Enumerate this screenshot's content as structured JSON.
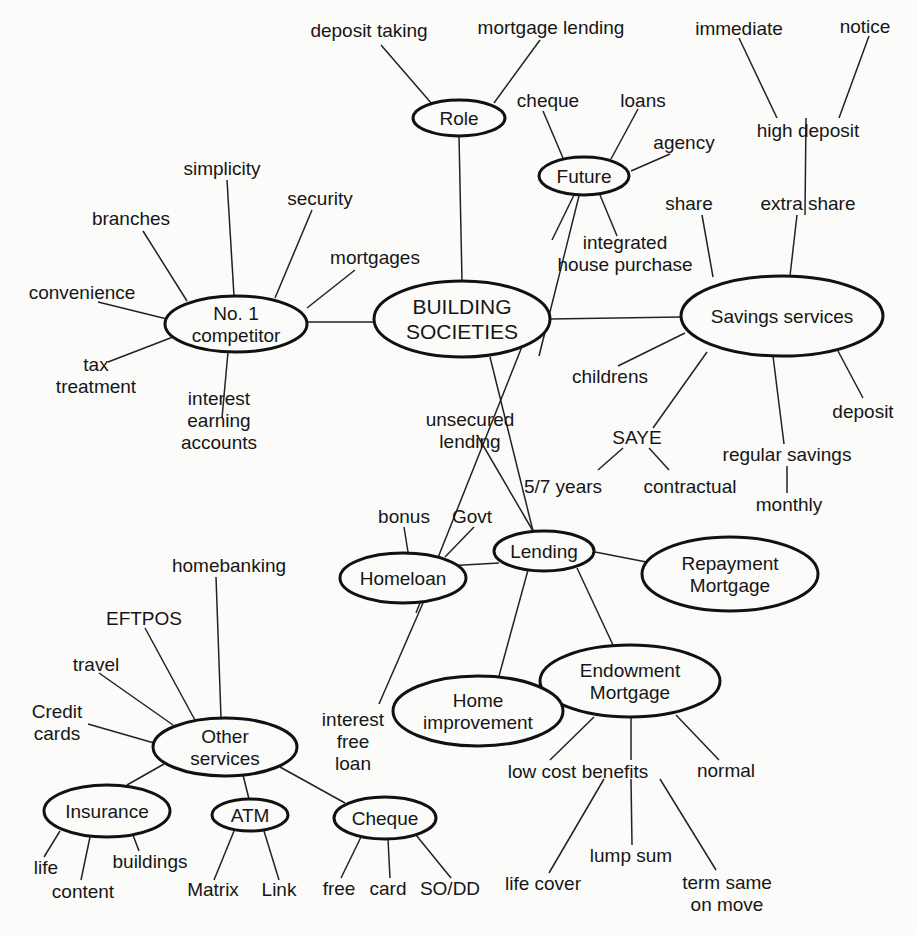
{
  "colors": {
    "ink": "#161616",
    "background": "#fbfbf9"
  },
  "nodes": [
    {
      "id": "building_societies",
      "lines": [
        "BUILDING",
        "SOCIETIES"
      ],
      "type": "ellipse",
      "cx": 462,
      "cy": 319,
      "rx": 88,
      "ry": 38,
      "hub": true
    },
    {
      "id": "role",
      "lines": [
        "Role"
      ],
      "type": "ellipse",
      "cx": 459,
      "cy": 118,
      "rx": 46,
      "ry": 18
    },
    {
      "id": "future",
      "lines": [
        "Future"
      ],
      "type": "ellipse",
      "cx": 584,
      "cy": 176,
      "rx": 45,
      "ry": 19
    },
    {
      "id": "no1_competitor",
      "lines": [
        "No. 1",
        "competitor"
      ],
      "type": "ellipse",
      "cx": 236,
      "cy": 324,
      "rx": 71,
      "ry": 28
    },
    {
      "id": "savings_services",
      "lines": [
        "Savings services"
      ],
      "type": "ellipse",
      "cx": 782,
      "cy": 316,
      "rx": 101,
      "ry": 40
    },
    {
      "id": "lending",
      "lines": [
        "Lending"
      ],
      "type": "ellipse",
      "cx": 544,
      "cy": 551,
      "rx": 50,
      "ry": 20
    },
    {
      "id": "homeloan",
      "lines": [
        "Homeloan"
      ],
      "type": "ellipse",
      "cx": 403,
      "cy": 578,
      "rx": 63,
      "ry": 25
    },
    {
      "id": "repayment_mortgage",
      "lines": [
        "Repayment",
        "Mortgage"
      ],
      "type": "ellipse",
      "cx": 730,
      "cy": 574,
      "rx": 88,
      "ry": 37
    },
    {
      "id": "endowment_mortgage",
      "lines": [
        "Endowment",
        "Mortgage"
      ],
      "type": "ellipse",
      "cx": 630,
      "cy": 681,
      "rx": 90,
      "ry": 36
    },
    {
      "id": "home_improvement",
      "lines": [
        "Home",
        "improvement"
      ],
      "type": "ellipse",
      "cx": 478,
      "cy": 711,
      "rx": 85,
      "ry": 35
    },
    {
      "id": "other_services",
      "lines": [
        "Other",
        "services"
      ],
      "type": "ellipse",
      "cx": 225,
      "cy": 747,
      "rx": 72,
      "ry": 29
    },
    {
      "id": "insurance",
      "lines": [
        "Insurance"
      ],
      "type": "ellipse",
      "cx": 107,
      "cy": 811,
      "rx": 63,
      "ry": 26
    },
    {
      "id": "atm",
      "lines": [
        "ATM"
      ],
      "type": "ellipse",
      "cx": 250,
      "cy": 815,
      "rx": 38,
      "ry": 16
    },
    {
      "id": "cheque_node",
      "lines": [
        "Cheque"
      ],
      "type": "ellipse",
      "cx": 385,
      "cy": 818,
      "rx": 51,
      "ry": 21
    },
    {
      "id": "deposit_taking",
      "lines": [
        "deposit taking"
      ],
      "type": "text",
      "cx": 369,
      "cy": 30
    },
    {
      "id": "mortgage_lending",
      "lines": [
        "mortgage lending"
      ],
      "type": "text",
      "cx": 551,
      "cy": 27
    },
    {
      "id": "cheque",
      "lines": [
        "cheque"
      ],
      "type": "text",
      "cx": 548,
      "cy": 100
    },
    {
      "id": "loans",
      "lines": [
        "loans"
      ],
      "type": "text",
      "cx": 643,
      "cy": 100
    },
    {
      "id": "agency",
      "lines": [
        "agency"
      ],
      "type": "text",
      "cx": 684,
      "cy": 142
    },
    {
      "id": "integrated_house_purchase",
      "lines": [
        "integrated",
        "house purchase"
      ],
      "type": "text",
      "cx": 625,
      "cy": 253
    },
    {
      "id": "immediate",
      "lines": [
        "immediate"
      ],
      "type": "text",
      "cx": 739,
      "cy": 28
    },
    {
      "id": "notice",
      "lines": [
        "notice"
      ],
      "type": "text",
      "cx": 865,
      "cy": 26
    },
    {
      "id": "high_deposit",
      "lines": [
        "high deposit"
      ],
      "type": "text",
      "cx": 808,
      "cy": 130
    },
    {
      "id": "share",
      "lines": [
        "share"
      ],
      "type": "text",
      "cx": 689,
      "cy": 203
    },
    {
      "id": "extra_share",
      "lines": [
        "extra share"
      ],
      "type": "text",
      "cx": 808,
      "cy": 203
    },
    {
      "id": "childrens",
      "lines": [
        "childrens"
      ],
      "type": "text",
      "cx": 610,
      "cy": 376
    },
    {
      "id": "deposit",
      "lines": [
        "deposit"
      ],
      "type": "text",
      "cx": 863,
      "cy": 411
    },
    {
      "id": "saye",
      "lines": [
        "SAYE"
      ],
      "type": "text",
      "cx": 637,
      "cy": 437
    },
    {
      "id": "regular_savings",
      "lines": [
        "regular savings"
      ],
      "type": "text",
      "cx": 787,
      "cy": 454
    },
    {
      "id": "five_seven_years",
      "lines": [
        "5/7 years"
      ],
      "type": "text",
      "cx": 563,
      "cy": 486
    },
    {
      "id": "contractual",
      "lines": [
        "contractual"
      ],
      "type": "text",
      "cx": 690,
      "cy": 486
    },
    {
      "id": "monthly",
      "lines": [
        "monthly"
      ],
      "type": "text",
      "cx": 789,
      "cy": 504
    },
    {
      "id": "simplicity",
      "lines": [
        "simplicity"
      ],
      "type": "text",
      "cx": 222,
      "cy": 168
    },
    {
      "id": "security",
      "lines": [
        "security"
      ],
      "type": "text",
      "cx": 320,
      "cy": 198
    },
    {
      "id": "branches",
      "lines": [
        "branches"
      ],
      "type": "text",
      "cx": 131,
      "cy": 218
    },
    {
      "id": "mortgages",
      "lines": [
        "mortgages"
      ],
      "type": "text",
      "cx": 375,
      "cy": 257
    },
    {
      "id": "convenience",
      "lines": [
        "convenience"
      ],
      "type": "text",
      "cx": 82,
      "cy": 292
    },
    {
      "id": "tax_treatment",
      "lines": [
        "tax",
        "treatment"
      ],
      "type": "text",
      "cx": 96,
      "cy": 375
    },
    {
      "id": "interest_earning_accounts",
      "lines": [
        "interest",
        "earning",
        "accounts"
      ],
      "type": "text",
      "cx": 219,
      "cy": 420
    },
    {
      "id": "unsecured_lending",
      "lines": [
        "unsecured",
        "lending"
      ],
      "type": "text",
      "cx": 470,
      "cy": 430
    },
    {
      "id": "bonus",
      "lines": [
        "bonus"
      ],
      "type": "text",
      "cx": 404,
      "cy": 516
    },
    {
      "id": "govt",
      "lines": [
        "Govt"
      ],
      "type": "text",
      "cx": 472,
      "cy": 516
    },
    {
      "id": "homebanking",
      "lines": [
        "homebanking"
      ],
      "type": "text",
      "cx": 229,
      "cy": 565
    },
    {
      "id": "eftpos",
      "lines": [
        "EFTPOS"
      ],
      "type": "text",
      "cx": 144,
      "cy": 618
    },
    {
      "id": "travel",
      "lines": [
        "travel"
      ],
      "type": "text",
      "cx": 96,
      "cy": 664
    },
    {
      "id": "credit_cards",
      "lines": [
        "Credit",
        "cards"
      ],
      "type": "text",
      "cx": 57,
      "cy": 722
    },
    {
      "id": "interest_free_loan",
      "lines": [
        "interest",
        "free",
        "loan"
      ],
      "type": "text",
      "cx": 353,
      "cy": 741
    },
    {
      "id": "low_cost_benefits",
      "lines": [
        "low cost benefits"
      ],
      "type": "text",
      "cx": 578,
      "cy": 771
    },
    {
      "id": "normal",
      "lines": [
        "normal"
      ],
      "type": "text",
      "cx": 726,
      "cy": 770
    },
    {
      "id": "life",
      "lines": [
        "life"
      ],
      "type": "text",
      "cx": 46,
      "cy": 867
    },
    {
      "id": "buildings",
      "lines": [
        "buildings"
      ],
      "type": "text",
      "cx": 150,
      "cy": 861
    },
    {
      "id": "content",
      "lines": [
        "content"
      ],
      "type": "text",
      "cx": 83,
      "cy": 891
    },
    {
      "id": "matrix",
      "lines": [
        "Matrix"
      ],
      "type": "text",
      "cx": 213,
      "cy": 889
    },
    {
      "id": "link",
      "lines": [
        "Link"
      ],
      "type": "text",
      "cx": 279,
      "cy": 889
    },
    {
      "id": "free",
      "lines": [
        "free"
      ],
      "type": "text",
      "cx": 339,
      "cy": 888
    },
    {
      "id": "card",
      "lines": [
        "card"
      ],
      "type": "text",
      "cx": 388,
      "cy": 888
    },
    {
      "id": "so_dd",
      "lines": [
        "SO/DD"
      ],
      "type": "text",
      "cx": 450,
      "cy": 888
    },
    {
      "id": "lump_sum",
      "lines": [
        "lump sum"
      ],
      "type": "text",
      "cx": 631,
      "cy": 855
    },
    {
      "id": "life_cover",
      "lines": [
        "life cover"
      ],
      "type": "text",
      "cx": 543,
      "cy": 883
    },
    {
      "id": "term_same_on_move",
      "lines": [
        "term same",
        "on move"
      ],
      "type": "text",
      "cx": 727,
      "cy": 893
    }
  ],
  "edges": [
    [
      462,
      281,
      459,
      136
    ],
    [
      432,
      104,
      381,
      45
    ],
    [
      494,
      103,
      540,
      40
    ],
    [
      539,
      356,
      584,
      176
    ],
    [
      563,
      158,
      543,
      111
    ],
    [
      611,
      159,
      638,
      109
    ],
    [
      631,
      171,
      670,
      154
    ],
    [
      574,
      195,
      552,
      240
    ],
    [
      600,
      195,
      617,
      236
    ],
    [
      550,
      319,
      681,
      317
    ],
    [
      713,
      277,
      702,
      215
    ],
    [
      790,
      276,
      797,
      215
    ],
    [
      806,
      118,
      805,
      215
    ],
    [
      839,
      118,
      869,
      36
    ],
    [
      777,
      118,
      739,
      38
    ],
    [
      685,
      333,
      618,
      366
    ],
    [
      707,
      352,
      653,
      428
    ],
    [
      773,
      356,
      784,
      444
    ],
    [
      838,
      351,
      863,
      398
    ],
    [
      623,
      448,
      598,
      470
    ],
    [
      649,
      448,
      669,
      470
    ],
    [
      787,
      466,
      787,
      493
    ],
    [
      374,
      322,
      307,
      322
    ],
    [
      187,
      301,
      143,
      231
    ],
    [
      234,
      296,
      227,
      180
    ],
    [
      275,
      298,
      312,
      210
    ],
    [
      307,
      308,
      355,
      270
    ],
    [
      171,
      320,
      98,
      302
    ],
    [
      173,
      337,
      108,
      362
    ],
    [
      228,
      352,
      222,
      418
    ],
    [
      523,
      344,
      416,
      613
    ],
    [
      490,
      357,
      533,
      531
    ],
    [
      477,
      435,
      533,
      531
    ],
    [
      408,
      552,
      404,
      527
    ],
    [
      445,
      557,
      474,
      527
    ],
    [
      499,
      563,
      446,
      566
    ],
    [
      595,
      552,
      667,
      566
    ],
    [
      528,
      570,
      499,
      676
    ],
    [
      577,
      568,
      613,
      645
    ],
    [
      423,
      603,
      379,
      704
    ],
    [
      221,
      718,
      216,
      577
    ],
    [
      196,
      722,
      145,
      628
    ],
    [
      173,
      725,
      99,
      673
    ],
    [
      154,
      743,
      88,
      724
    ],
    [
      164,
      764,
      127,
      785
    ],
    [
      243,
      775,
      249,
      799
    ],
    [
      280,
      767,
      345,
      803
    ],
    [
      60,
      831,
      44,
      857
    ],
    [
      90,
      837,
      81,
      880
    ],
    [
      133,
      835,
      139,
      851
    ],
    [
      234,
      831,
      214,
      880
    ],
    [
      264,
      831,
      279,
      880
    ],
    [
      361,
      837,
      341,
      878
    ],
    [
      388,
      839,
      390,
      878
    ],
    [
      416,
      835,
      451,
      878
    ],
    [
      594,
      717,
      550,
      760
    ],
    [
      631,
      717,
      631,
      760
    ],
    [
      676,
      715,
      719,
      760
    ],
    [
      604,
      779,
      549,
      873
    ],
    [
      631,
      779,
      632,
      845
    ],
    [
      660,
      779,
      716,
      870
    ]
  ]
}
